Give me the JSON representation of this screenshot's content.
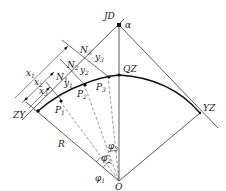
{
  "diagram": {
    "points": {
      "JD": "JD",
      "QZ": "QZ",
      "ZY": "ZY",
      "YZ": "YZ",
      "O": "O",
      "P1": "P",
      "P2": "P",
      "P3": "P",
      "N1": "N",
      "N2": "N",
      "N3": "N"
    },
    "subscripts": {
      "one": "1",
      "two": "2",
      "three": "3"
    },
    "labels": {
      "alpha": "α",
      "radius": "R",
      "x": "x",
      "y": "y",
      "phi": "φ"
    },
    "colors": {
      "line": "#1a1a1a",
      "guide": "#555555",
      "background": "#ffffff"
    }
  }
}
